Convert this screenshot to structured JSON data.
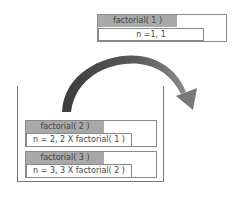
{
  "diagram": {
    "popped_frame": {
      "title": "factorial( 1 )",
      "detail": "n =1, 1"
    },
    "stack_frames": [
      {
        "title": "factorial( 2 )",
        "detail": "n  = 2, 2 X factorial( 1 )"
      },
      {
        "title": "factorial( 3 )",
        "detail": "n = 3, 3 X factorial( 2 )"
      }
    ],
    "colors": {
      "header_fill": "#a9a9a9",
      "border": "#8a8a8a",
      "arrow": "#555555"
    }
  }
}
